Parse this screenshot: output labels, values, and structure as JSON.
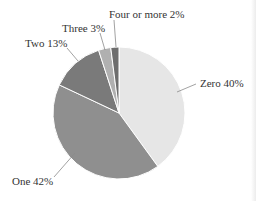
{
  "chart_data": {
    "type": "pie",
    "title": "",
    "start_angle_deg": 0,
    "direction": "clockwise",
    "slices": [
      {
        "label": "Zero",
        "value": 40,
        "display": "Zero 40%",
        "color": "#e6e6e6"
      },
      {
        "label": "One",
        "value": 42,
        "display": "One 42%",
        "color": "#8f8f8f"
      },
      {
        "label": "Two",
        "value": 13,
        "display": "Two 13%",
        "color": "#7a7a7a"
      },
      {
        "label": "Three",
        "value": 3,
        "display": "Three 3%",
        "color": "#b0b0b0"
      },
      {
        "label": "Four or more",
        "value": 2,
        "display": "Four or more 2%",
        "color": "#6e6e6e"
      }
    ],
    "categories": [
      "Zero",
      "One",
      "Two",
      "Three",
      "Four or more"
    ],
    "values": [
      40,
      42,
      13,
      3,
      2
    ],
    "units": "%",
    "legend": "none (labels with leader lines)"
  },
  "labels": {
    "zero": "Zero 40%",
    "one": "One 42%",
    "two": "Two 13%",
    "three": "Three 3%",
    "four": "Four or more 2%"
  },
  "geometry": {
    "cx": 119,
    "cy": 113,
    "r": 66
  }
}
